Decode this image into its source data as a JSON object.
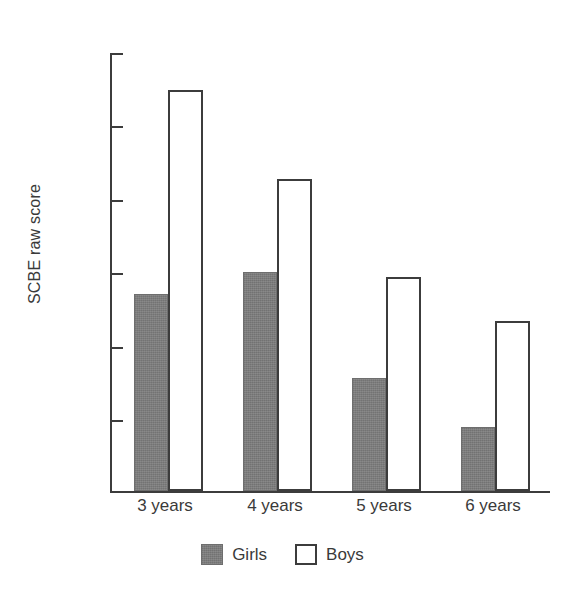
{
  "chart_data": {
    "type": "bar",
    "title": "",
    "subtitle": "",
    "xlabel": "",
    "ylabel": "SCBE raw score",
    "categories": [
      "3 years",
      "4 years",
      "5 years",
      "6 years"
    ],
    "series": [
      {
        "name": "Girls",
        "color": "#7c7c7c",
        "fill": "solid-gray",
        "values": [
          19.4,
          20.0,
          17.1,
          15.75
        ]
      },
      {
        "name": "Boys",
        "color": "#ffffff",
        "fill": "open-white",
        "values": [
          25.0,
          22.55,
          19.85,
          18.65
        ]
      }
    ],
    "ylim": [
      14,
      26
    ],
    "yticks": [
      14,
      16,
      18,
      20,
      22,
      24,
      26
    ],
    "ytick_labels": [
      "14",
      "16",
      "18",
      "20",
      "22",
      "24",
      "26"
    ],
    "grid": false,
    "legend_position": "bottom-center",
    "legend_entries": [
      "Girls",
      "Boys"
    ],
    "annotations": []
  },
  "colors": {
    "axis": "#3c3c3c",
    "text": "#3a3a3a",
    "girls_fill": "#7c7c7c",
    "boys_fill": "#ffffff",
    "background": "#ffffff"
  }
}
